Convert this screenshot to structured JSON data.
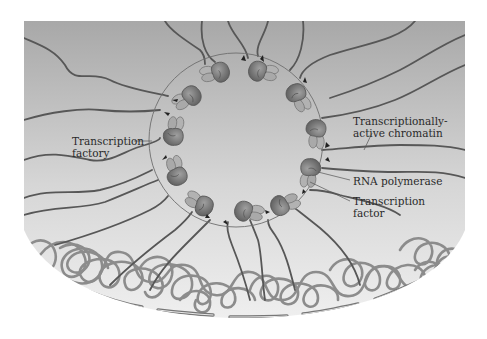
{
  "figure": {
    "colors": {
      "background_top": "#a9a9a9",
      "background_bottom": "#ececec",
      "active_chromatin": "#555555",
      "inactive_chromatin": "#8a8a8a",
      "polymerase": "#7a7a7a",
      "factor": "#a5a5a5",
      "factory_boundary": "#6a6a6a",
      "nuclear_envelope": "#7c7c7c"
    }
  },
  "labels": {
    "transcription_factory": [
      "Transcription",
      "factory"
    ],
    "active_chromatin": [
      "Transcriptionally-",
      "active chromatin"
    ],
    "rna_polymerase": [
      "RNA polymerase"
    ],
    "transcription_factor": [
      "Transcription",
      "factor"
    ]
  },
  "components": [
    {
      "name": "transcription-factory",
      "description": "circular region containing clustered RNA polymerases"
    },
    {
      "name": "rna-polymerase",
      "count": 12
    },
    {
      "name": "transcription-factor",
      "count": 12
    },
    {
      "name": "transcriptionally-active-chromatin",
      "description": "loops extending from periphery into factory"
    },
    {
      "name": "inactive-chromatin",
      "description": "tangled chromatin near nuclear envelope"
    },
    {
      "name": "nuclear-envelope",
      "description": "dashed arc at bottom"
    }
  ]
}
